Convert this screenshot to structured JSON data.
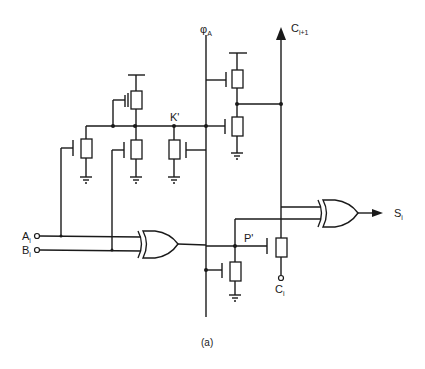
{
  "diagram": {
    "caption": "(a)",
    "labels": {
      "phi": {
        "main": "φ",
        "sub": "A"
      },
      "carry_out": {
        "main": "C",
        "sub": "i+1"
      },
      "k_node": "K'",
      "p_node": "P'",
      "input_a": {
        "main": "A",
        "sub": "i"
      },
      "input_b": {
        "main": "B",
        "sub": "i"
      },
      "carry_in": {
        "main": "C",
        "sub": "i"
      },
      "sum_out": {
        "main": "S",
        "sub": "i"
      }
    },
    "gates": [
      "XOR (Ai, Bi) -> P'",
      "XOR (Ci+1 line, P') -> Si"
    ],
    "transistors": [
      "PMOS precharge on K'",
      "NMOS pulldowns on K' (x3)",
      "NMOS pair on Ci+1 clocked by φA",
      "NMOS pass from P' to Ci",
      "NMOS pulldown on P' node"
    ]
  }
}
